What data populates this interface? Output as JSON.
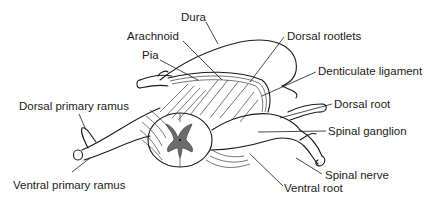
{
  "diagram": {
    "labels": [
      {
        "id": "dura",
        "text": "Dura",
        "x": 181,
        "y": 18
      },
      {
        "id": "arachnoid",
        "text": "Arachnoid",
        "x": 127,
        "y": 36
      },
      {
        "id": "pia",
        "text": "Pia",
        "x": 142,
        "y": 55
      },
      {
        "id": "dorsal-rootlets",
        "text": "Dorsal rootlets",
        "x": 287,
        "y": 31
      },
      {
        "id": "denticulate-ligament",
        "text": "Denticulate ligament",
        "x": 318,
        "y": 66
      },
      {
        "id": "dorsal-primary-ramus",
        "text": "Dorsal primary ramus",
        "x": 19,
        "y": 107
      },
      {
        "id": "dorsal-root",
        "text": "Dorsal root",
        "x": 334,
        "y": 99
      },
      {
        "id": "spinal-ganglion",
        "text": "Spinal ganglion",
        "x": 328,
        "y": 126
      },
      {
        "id": "spinal-nerve",
        "text": "Spinal nerve",
        "x": 325,
        "y": 169
      },
      {
        "id": "ventral-primary-ramus",
        "text": "Ventral primary ramus",
        "x": 13,
        "y": 177
      },
      {
        "id": "ventral-root",
        "text": "Ventral root",
        "x": 284,
        "y": 182
      }
    ]
  }
}
